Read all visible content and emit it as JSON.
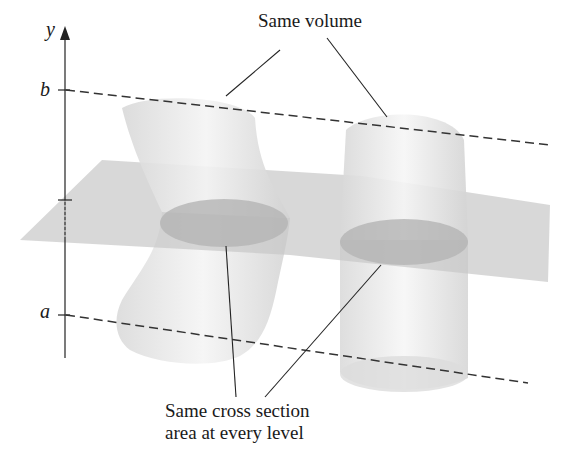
{
  "figure": {
    "axis_label": "y",
    "tick_upper_label": "b",
    "tick_lower_label": "a",
    "annotation_top": "Same volume",
    "annotation_bottom_line1": "Same cross section",
    "annotation_bottom_line2": "area at every level"
  },
  "colors": {
    "background": "#ffffff",
    "plane": "#c8c8c8",
    "solid": "#e2e2e2",
    "cross_section": "#b4b4b4",
    "line": "#222222",
    "dash": "#333333"
  }
}
